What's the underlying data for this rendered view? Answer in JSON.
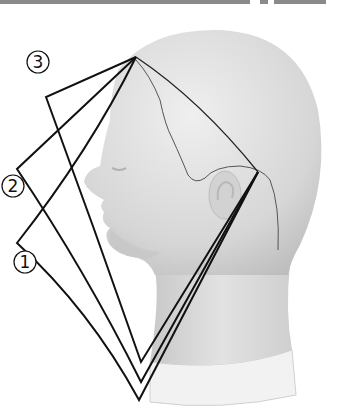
{
  "figure": {
    "labels": [
      {
        "id": "3",
        "text": "3",
        "x": 38,
        "y": 68
      },
      {
        "id": "2",
        "text": "2",
        "x": 13,
        "y": 192
      },
      {
        "id": "1",
        "text": "1",
        "x": 25,
        "y": 268
      }
    ],
    "apex": {
      "x": 136,
      "y": 57
    },
    "ear_point": {
      "x": 258,
      "y": 172
    },
    "triangles": [
      {
        "id": "3",
        "left": {
          "x": 46,
          "y": 97
        },
        "bottom": {
          "x": 141,
          "y": 362
        }
      },
      {
        "id": "2",
        "left": {
          "x": 17,
          "y": 169
        },
        "bottom": {
          "x": 141,
          "y": 382
        }
      },
      {
        "id": "1",
        "left": {
          "x": 17,
          "y": 243
        },
        "bottom": {
          "x": 139,
          "y": 400
        }
      }
    ],
    "colors": {
      "line": "#111111",
      "head": "#dcdcdc",
      "head_shade": "#c6c6c6",
      "collar": "#f0f0f0",
      "bar": "#8a8a8a"
    }
  }
}
